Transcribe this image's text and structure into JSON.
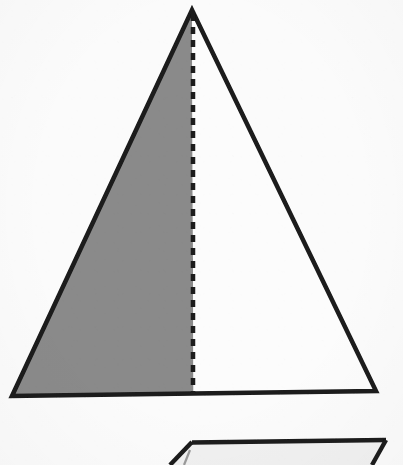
{
  "document": {
    "kind": "scanned-geometry-figure",
    "background_color": "#fbfbfb",
    "stroke_color": "#1a1a1a",
    "shaded_color": "#8a8a8a",
    "unshaded_color": "#fcfcfc",
    "stroke_width": 4.5,
    "width": 403,
    "height": 465
  },
  "figures": [
    {
      "name": "main-triangle",
      "type": "triangle",
      "apex": {
        "x": 192,
        "y": 10
      },
      "base_left": {
        "x": 12,
        "y": 396
      },
      "base_right": {
        "x": 376,
        "y": 391
      },
      "outline_points": "192,10 376,391 12,396",
      "altitude": {
        "name": "altitude-dashed-line",
        "from": {
          "x": 193,
          "y": 14
        },
        "to": {
          "x": 193,
          "y": 393
        },
        "style": "dashed",
        "dash_length": 7,
        "dash_gap": 6,
        "dash_width": 4.5
      },
      "regions": [
        {
          "name": "left-half-shaded",
          "fill": "#8a8a8a",
          "points": "192,11 193,393 13,395"
        },
        {
          "name": "right-half-unshaded",
          "fill": "#fcfcfc",
          "points": "192,11 375,391 193,393"
        }
      ]
    },
    {
      "name": "second-figure-partial",
      "type": "triangle-top-edge-cropped",
      "corner": {
        "x": 192,
        "y": 442
      },
      "right_end": {
        "x": 386,
        "y": 440
      },
      "left_diagonal_end": {
        "x": 170,
        "y": 465
      },
      "right_diagonal_end": {
        "x": 372,
        "y": 465
      },
      "fill": "#f0f0f0"
    }
  ],
  "labels": []
}
